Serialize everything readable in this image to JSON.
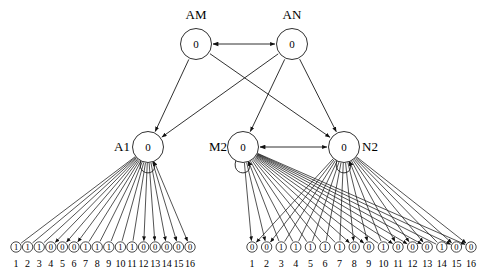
{
  "diagram": {
    "node_value": "0",
    "top_nodes": [
      {
        "id": "AM",
        "label": "AM",
        "value": "0",
        "x": 196,
        "y": 44,
        "label_x": 196,
        "label_y": 15
      },
      {
        "id": "AN",
        "label": "AN",
        "value": "0",
        "x": 292,
        "y": 44,
        "label_x": 292,
        "label_y": 15
      }
    ],
    "mid_nodes": [
      {
        "id": "A1",
        "label": "A1",
        "value": "0",
        "x": 148,
        "y": 147,
        "label_x": 122,
        "label_y": 147
      },
      {
        "id": "M2",
        "label": "M2",
        "value": "0",
        "x": 243,
        "y": 147,
        "label_x": 218,
        "label_y": 147
      },
      {
        "id": "N2",
        "label": "N2",
        "value": "0",
        "x": 344,
        "y": 147,
        "label_x": 370,
        "label_y": 147
      }
    ],
    "edges_top": [
      {
        "from": "AM",
        "to": "AN",
        "arrow": "both"
      },
      {
        "from": "AM",
        "to": "A1",
        "arrow": "to"
      },
      {
        "from": "AM",
        "to": "N2",
        "arrow": "to"
      },
      {
        "from": "AN",
        "to": "A1",
        "arrow": "to"
      },
      {
        "from": "AN",
        "to": "M2",
        "arrow": "to"
      },
      {
        "from": "AN",
        "to": "N2",
        "arrow": "to"
      },
      {
        "from": "M2",
        "to": "N2",
        "arrow": "both"
      }
    ],
    "left_group": {
      "parent": "A1",
      "indices": [
        "1",
        "2",
        "3",
        "4",
        "5",
        "6",
        "7",
        "8",
        "9",
        "10",
        "11",
        "12",
        "13",
        "14",
        "15",
        "16"
      ],
      "values": [
        "1",
        "1",
        "1",
        "0",
        "0",
        "0",
        "1",
        "1",
        "1",
        "1",
        "1",
        "0",
        "0",
        "0",
        "0",
        "0"
      ],
      "filled_arrow": [
        false,
        false,
        false,
        true,
        true,
        true,
        false,
        false,
        false,
        false,
        false,
        true,
        true,
        true,
        true,
        true
      ],
      "x_start": 16,
      "x_step": 11.6,
      "y": 247,
      "idx_y": 267
    },
    "right_group": {
      "parent_left": "M2",
      "parent_right": "N2",
      "indices": [
        "1",
        "2",
        "3",
        "4",
        "5",
        "6",
        "7",
        "8",
        "9",
        "10",
        "11",
        "12",
        "13",
        "14",
        "15",
        "16"
      ],
      "values": [
        "0",
        "0",
        "1",
        "1",
        "1",
        "1",
        "1",
        "0",
        "0",
        "1",
        "0",
        "0",
        "0",
        "1",
        "0",
        "0"
      ],
      "filled_arrow": [
        true,
        true,
        false,
        false,
        false,
        false,
        false,
        true,
        true,
        false,
        true,
        true,
        true,
        false,
        true,
        true
      ],
      "x_start": 252,
      "x_step": 14.6,
      "y": 247,
      "idx_y": 267
    },
    "colors": {
      "stroke": "#1a1a1a",
      "node_fill": "#ffffff",
      "text": "#000000",
      "background": "#ffffff"
    }
  }
}
